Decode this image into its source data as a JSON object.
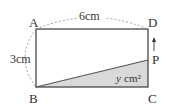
{
  "diagram": {
    "points": {
      "A": {
        "label": "A",
        "x": 36,
        "y": 29
      },
      "D": {
        "label": "D",
        "x": 148,
        "y": 29
      },
      "B": {
        "label": "B",
        "x": 36,
        "y": 87
      },
      "C": {
        "label": "C",
        "x": 148,
        "y": 87
      },
      "P": {
        "label": "P",
        "x": 148,
        "y": 60
      }
    },
    "dimensions": {
      "top": "6cm",
      "left": "3cm"
    },
    "shaded_area_label": {
      "var": "y",
      "unit": "cm²"
    },
    "arrow": "up",
    "colors": {
      "stroke": "#555555",
      "shade": "#d9d9d9",
      "dash": "#888888"
    }
  }
}
